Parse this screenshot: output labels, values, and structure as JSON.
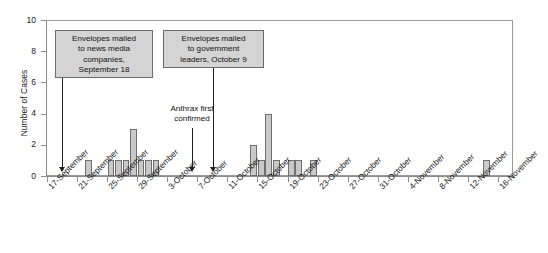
{
  "chart_data": {
    "type": "bar",
    "title": "",
    "xlabel": "",
    "ylabel": "Number of Cases",
    "ylim": [
      0,
      10
    ],
    "yticks": [
      0,
      2,
      4,
      6,
      8,
      10
    ],
    "grid": false,
    "legend": "none",
    "x_axis_start": "17-September",
    "x_axis_end": "17-November",
    "x_tick_labels": [
      "17-September",
      "21-September",
      "25-September",
      "29-September",
      "3-October",
      "7-October",
      "11-October",
      "15-October",
      "19-October",
      "23-October",
      "27-October",
      "31-October",
      "4-November",
      "8-November",
      "12-November",
      "16-November"
    ],
    "x_tick_day_offsets": [
      0,
      4,
      8,
      12,
      16,
      20,
      24,
      28,
      32,
      36,
      40,
      44,
      48,
      52,
      56,
      60
    ],
    "bar_color": "#c9c9c9",
    "bar_border_color": "#6f6f6f",
    "categories": [
      "17-September",
      "18-September",
      "19-September",
      "20-September",
      "21-September",
      "22-September",
      "23-September",
      "24-September",
      "25-September",
      "26-September",
      "27-September",
      "28-September",
      "29-September",
      "30-September",
      "1-October",
      "2-October",
      "3-October",
      "4-October",
      "5-October",
      "6-October",
      "7-October",
      "8-October",
      "9-October",
      "10-October",
      "11-October",
      "12-October",
      "13-October",
      "14-October",
      "15-October",
      "16-October",
      "17-October",
      "18-October",
      "19-October",
      "20-October",
      "21-October",
      "22-October",
      "23-October",
      "24-October",
      "25-October",
      "26-October",
      "27-October",
      "28-October",
      "29-October",
      "30-October",
      "31-October",
      "1-November",
      "2-November",
      "3-November",
      "4-November",
      "5-November",
      "6-November",
      "7-November",
      "8-November",
      "9-November",
      "10-November",
      "11-November",
      "12-November",
      "13-November",
      "14-November",
      "15-November",
      "16-November",
      "17-November"
    ],
    "values": [
      0,
      0,
      0,
      0,
      0,
      1,
      0,
      0,
      1,
      1,
      1,
      3,
      1,
      1,
      1,
      0,
      0,
      0,
      0,
      0,
      0,
      0,
      0,
      0,
      0,
      0,
      0,
      2,
      1,
      4,
      1,
      0,
      1,
      1,
      0,
      1,
      0,
      0,
      0,
      0,
      0,
      0,
      0,
      0,
      0,
      0,
      0,
      0,
      0,
      0,
      0,
      0,
      0,
      0,
      0,
      0,
      0,
      0,
      1,
      0,
      0,
      0
    ],
    "total_cases": 22,
    "annotations": [
      {
        "id": "news-media-envelopes",
        "text": "Envelopes mailed to news media companies, September 18",
        "lines": [
          "Envelopes mailed",
          "to news media",
          "companies,",
          "September 18"
        ],
        "points_to_day": "18-September",
        "style": "boxed",
        "arrow": "down"
      },
      {
        "id": "government-envelopes",
        "text": "Envelopes mailed to government leaders, October 9",
        "lines": [
          "Envelopes mailed",
          "to government",
          "leaders, October 9"
        ],
        "points_to_day": "9-October",
        "style": "boxed",
        "arrow": "down"
      },
      {
        "id": "anthrax-first-confirmed",
        "text": "Anthrax first confirmed",
        "lines": [
          "Anthrax first",
          "confirmed"
        ],
        "points_to_day": "4-October",
        "style": "plain",
        "arrow": "down"
      }
    ]
  },
  "axes": {
    "y_title": "Number of Cases",
    "y_tick_labels": [
      "0",
      "2",
      "4",
      "6",
      "8",
      "10"
    ]
  },
  "annotation_text": {
    "box1_line1": "Envelopes mailed",
    "box1_line2": "to news media",
    "box1_line3": "companies,",
    "box1_line4": "September 18",
    "box2_line1": "Envelopes mailed",
    "box2_line2": "to government",
    "box2_line3": "leaders, October 9",
    "note1_line1": "Anthrax first",
    "note1_line2": "confirmed"
  }
}
